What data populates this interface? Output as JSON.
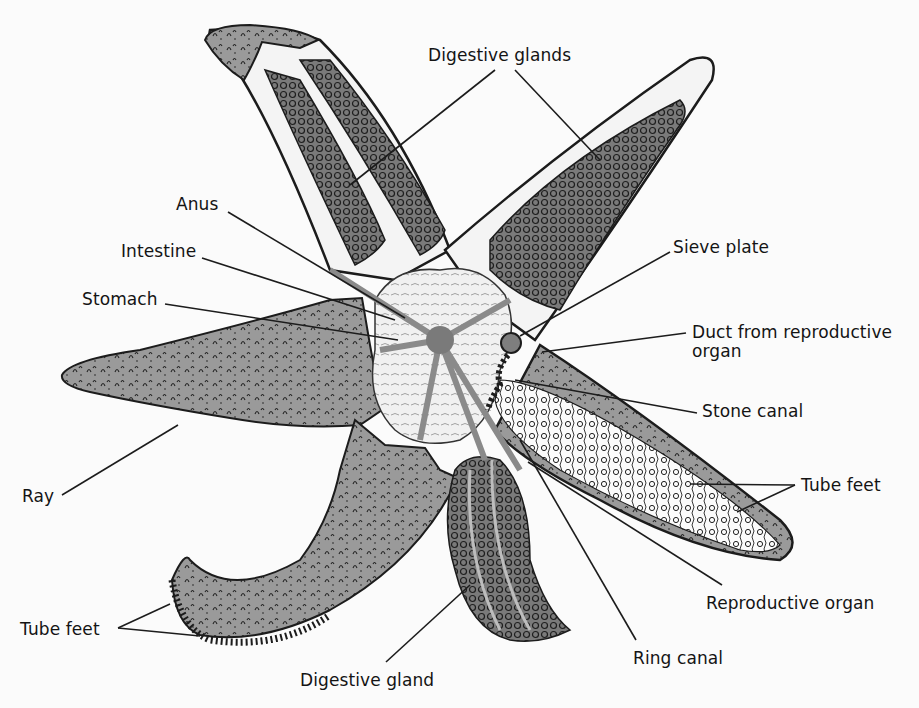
{
  "diagram": {
    "colors": {
      "background": "#fbfbfb",
      "body_fill": "#9a9a9a",
      "gland_fill": "#6f6f6f",
      "outline": "#1c1c1c",
      "stomach_fill": "#ececec",
      "text": "#141414"
    },
    "labels": [
      {
        "id": "digestive-glands",
        "text": "Digestive glands",
        "x": 428,
        "y": 46
      },
      {
        "id": "anus",
        "text": "Anus",
        "x": 176,
        "y": 195
      },
      {
        "id": "intestine",
        "text": "Intestine",
        "x": 121,
        "y": 242
      },
      {
        "id": "stomach",
        "text": "Stomach",
        "x": 82,
        "y": 290
      },
      {
        "id": "sieve-plate",
        "text": "Sieve plate",
        "x": 673,
        "y": 238
      },
      {
        "id": "duct-from-reproductive-organ",
        "text": "Duct from reproductive\norgan",
        "x": 692,
        "y": 323
      },
      {
        "id": "stone-canal",
        "text": "Stone canal",
        "x": 702,
        "y": 402
      },
      {
        "id": "tube-feet-right",
        "text": "Tube feet",
        "x": 801,
        "y": 476
      },
      {
        "id": "ray",
        "text": "Ray",
        "x": 22,
        "y": 487
      },
      {
        "id": "reproductive-organ",
        "text": "Reproductive organ",
        "x": 706,
        "y": 594
      },
      {
        "id": "tube-feet-left",
        "text": "Tube feet",
        "x": 20,
        "y": 620
      },
      {
        "id": "ring-canal",
        "text": "Ring canal",
        "x": 633,
        "y": 649
      },
      {
        "id": "digestive-gland",
        "text": "Digestive gland",
        "x": 300,
        "y": 671
      }
    ]
  }
}
